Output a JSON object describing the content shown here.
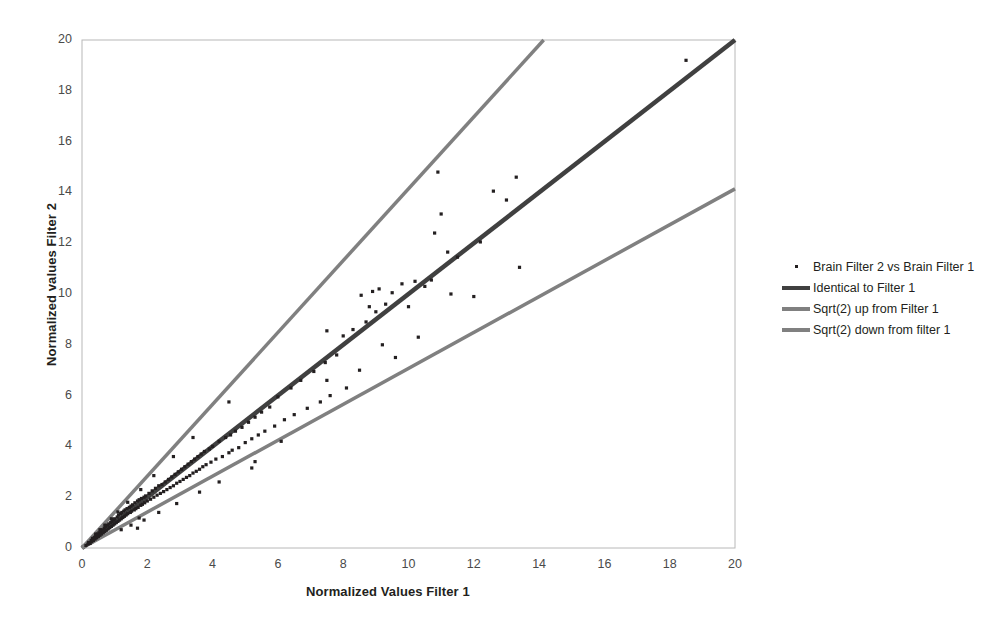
{
  "chart_data": {
    "type": "scatter",
    "title": "",
    "xlabel": "Normalized Values Filter 1",
    "ylabel": "Normalized values Filter 2",
    "xlim": [
      0,
      20
    ],
    "ylim": [
      0,
      20
    ],
    "xticks": [
      0,
      2,
      4,
      6,
      8,
      10,
      12,
      14,
      16,
      18,
      20
    ],
    "yticks": [
      0,
      2,
      4,
      6,
      8,
      10,
      12,
      14,
      16,
      18,
      20
    ],
    "grid": false,
    "legend_position": "right",
    "series": [
      {
        "name": "Brain Filter 2 vs Brain Filter 1",
        "type": "scatter",
        "marker": "square",
        "color": "#231f20",
        "points": [
          [
            0.12,
            0.1
          ],
          [
            0.18,
            0.15
          ],
          [
            0.2,
            0.22
          ],
          [
            0.25,
            0.18
          ],
          [
            0.28,
            0.3
          ],
          [
            0.3,
            0.25
          ],
          [
            0.32,
            0.38
          ],
          [
            0.35,
            0.3
          ],
          [
            0.38,
            0.42
          ],
          [
            0.4,
            0.35
          ],
          [
            0.42,
            0.5
          ],
          [
            0.45,
            0.4
          ],
          [
            0.48,
            0.55
          ],
          [
            0.5,
            0.45
          ],
          [
            0.52,
            0.6
          ],
          [
            0.55,
            0.5
          ],
          [
            0.58,
            0.65
          ],
          [
            0.6,
            0.55
          ],
          [
            0.62,
            0.72
          ],
          [
            0.65,
            0.6
          ],
          [
            0.68,
            0.78
          ],
          [
            0.7,
            0.65
          ],
          [
            0.72,
            0.85
          ],
          [
            0.75,
            0.7
          ],
          [
            0.78,
            0.9
          ],
          [
            0.8,
            0.75
          ],
          [
            0.82,
            0.95
          ],
          [
            0.85,
            0.8
          ],
          [
            0.88,
            1.0
          ],
          [
            0.9,
            0.85
          ],
          [
            0.92,
            1.05
          ],
          [
            0.95,
            0.9
          ],
          [
            0.98,
            1.1
          ],
          [
            1.0,
            0.95
          ],
          [
            1.0,
            1.15
          ],
          [
            1.05,
            1.0
          ],
          [
            1.08,
            1.22
          ],
          [
            1.1,
            1.05
          ],
          [
            1.12,
            1.3
          ],
          [
            1.15,
            1.1
          ],
          [
            1.18,
            1.35
          ],
          [
            1.2,
            1.15
          ],
          [
            1.22,
            1.4
          ],
          [
            1.25,
            1.2
          ],
          [
            1.28,
            1.45
          ],
          [
            1.3,
            1.25
          ],
          [
            1.32,
            1.5
          ],
          [
            1.35,
            1.3
          ],
          [
            1.38,
            1.55
          ],
          [
            1.4,
            1.35
          ],
          [
            1.45,
            1.6
          ],
          [
            1.48,
            1.4
          ],
          [
            1.5,
            1.65
          ],
          [
            1.52,
            1.45
          ],
          [
            1.55,
            1.7
          ],
          [
            1.6,
            1.5
          ],
          [
            1.62,
            1.78
          ],
          [
            1.65,
            1.55
          ],
          [
            1.7,
            1.85
          ],
          [
            1.72,
            1.6
          ],
          [
            1.75,
            1.9
          ],
          [
            1.8,
            1.68
          ],
          [
            1.82,
            1.95
          ],
          [
            1.85,
            1.72
          ],
          [
            1.9,
            2.0
          ],
          [
            1.92,
            1.78
          ],
          [
            1.95,
            2.05
          ],
          [
            1.7,
            0.78
          ],
          [
            1.75,
            1.18
          ],
          [
            2.0,
            1.85
          ],
          [
            2.05,
            2.15
          ],
          [
            2.1,
            1.92
          ],
          [
            2.15,
            2.25
          ],
          [
            2.2,
            2.0
          ],
          [
            2.25,
            2.35
          ],
          [
            2.3,
            2.08
          ],
          [
            2.35,
            2.45
          ],
          [
            2.4,
            2.15
          ],
          [
            2.45,
            2.5
          ],
          [
            2.5,
            2.22
          ],
          [
            2.55,
            2.6
          ],
          [
            2.6,
            2.3
          ],
          [
            2.65,
            2.7
          ],
          [
            2.7,
            2.38
          ],
          [
            2.75,
            2.8
          ],
          [
            2.8,
            2.45
          ],
          [
            2.85,
            2.9
          ],
          [
            2.9,
            2.55
          ],
          [
            2.95,
            3.0
          ],
          [
            3.0,
            2.62
          ],
          [
            3.05,
            3.1
          ],
          [
            3.1,
            2.7
          ],
          [
            3.15,
            3.2
          ],
          [
            3.2,
            2.78
          ],
          [
            3.25,
            3.3
          ],
          [
            3.3,
            2.85
          ],
          [
            3.35,
            3.4
          ],
          [
            3.4,
            2.95
          ],
          [
            3.45,
            3.5
          ],
          [
            3.5,
            3.02
          ],
          [
            3.55,
            3.6
          ],
          [
            3.6,
            3.1
          ],
          [
            3.65,
            3.7
          ],
          [
            3.7,
            3.2
          ],
          [
            3.75,
            3.8
          ],
          [
            3.8,
            3.28
          ],
          [
            3.9,
            3.9
          ],
          [
            3.95,
            3.38
          ],
          [
            4.0,
            4.0
          ],
          [
            4.1,
            3.5
          ],
          [
            4.2,
            4.2
          ],
          [
            4.3,
            3.6
          ],
          [
            4.4,
            4.35
          ],
          [
            4.5,
            3.75
          ],
          [
            4.55,
            4.45
          ],
          [
            4.6,
            3.85
          ],
          [
            4.7,
            4.6
          ],
          [
            4.8,
            3.95
          ],
          [
            4.5,
            5.75
          ],
          [
            4.9,
            4.75
          ],
          [
            5.0,
            4.15
          ],
          [
            5.1,
            4.95
          ],
          [
            5.2,
            4.3
          ],
          [
            5.3,
            5.15
          ],
          [
            5.4,
            4.45
          ],
          [
            5.5,
            5.35
          ],
          [
            5.2,
            3.15
          ],
          [
            5.6,
            4.6
          ],
          [
            5.75,
            5.55
          ],
          [
            5.9,
            4.8
          ],
          [
            6.0,
            5.95
          ],
          [
            6.2,
            5.05
          ],
          [
            6.4,
            6.3
          ],
          [
            6.5,
            5.25
          ],
          [
            6.7,
            6.6
          ],
          [
            6.9,
            5.5
          ],
          [
            7.1,
            6.95
          ],
          [
            7.3,
            5.75
          ],
          [
            7.45,
            7.3
          ],
          [
            7.5,
            8.55
          ],
          [
            7.6,
            6.0
          ],
          [
            7.8,
            7.6
          ],
          [
            7.5,
            6.6
          ],
          [
            8.0,
            8.35
          ],
          [
            8.1,
            6.3
          ],
          [
            8.3,
            8.6
          ],
          [
            8.5,
            7.0
          ],
          [
            8.55,
            9.95
          ],
          [
            8.7,
            8.9
          ],
          [
            8.8,
            9.5
          ],
          [
            8.9,
            10.1
          ],
          [
            9.0,
            9.3
          ],
          [
            9.1,
            10.2
          ],
          [
            9.2,
            8.0
          ],
          [
            9.3,
            9.6
          ],
          [
            9.5,
            10.05
          ],
          [
            9.6,
            7.5
          ],
          [
            9.8,
            10.4
          ],
          [
            10.0,
            9.5
          ],
          [
            10.2,
            10.5
          ],
          [
            10.3,
            8.3
          ],
          [
            10.5,
            10.3
          ],
          [
            10.7,
            10.55
          ],
          [
            10.8,
            12.4
          ],
          [
            10.9,
            14.8
          ],
          [
            11.0,
            13.15
          ],
          [
            11.2,
            11.65
          ],
          [
            11.3,
            10.0
          ],
          [
            11.5,
            11.45
          ],
          [
            12.0,
            9.9
          ],
          [
            12.2,
            12.05
          ],
          [
            12.6,
            14.05
          ],
          [
            13.0,
            13.7
          ],
          [
            13.3,
            14.6
          ],
          [
            13.4,
            11.05
          ],
          [
            18.5,
            19.2
          ],
          [
            6.1,
            4.2
          ],
          [
            5.3,
            3.4
          ],
          [
            4.2,
            2.6
          ],
          [
            3.6,
            2.2
          ],
          [
            2.9,
            1.75
          ],
          [
            2.35,
            1.4
          ],
          [
            1.9,
            1.1
          ],
          [
            1.5,
            0.9
          ],
          [
            1.2,
            0.72
          ],
          [
            3.4,
            4.35
          ],
          [
            2.8,
            3.6
          ],
          [
            2.2,
            2.85
          ],
          [
            1.8,
            2.3
          ],
          [
            1.4,
            1.8
          ],
          [
            1.1,
            1.42
          ],
          [
            0.9,
            1.15
          ],
          [
            0.7,
            0.9
          ],
          [
            0.55,
            0.72
          ],
          [
            0.42,
            0.55
          ]
        ]
      },
      {
        "name": "Identical to Filter 1",
        "type": "line",
        "color": "#404040",
        "slope": 1.0,
        "from": [
          0,
          0
        ],
        "to": [
          20,
          20
        ]
      },
      {
        "name": "Sqrt(2) up from Filter 1",
        "type": "line",
        "color": "#808080",
        "slope": 1.414,
        "from": [
          0,
          0
        ],
        "to": [
          14.14,
          20
        ]
      },
      {
        "name": "Sqrt(2) down from filter 1",
        "type": "line",
        "color": "#808080",
        "slope": 0.707,
        "from": [
          0,
          0
        ],
        "to": [
          20,
          14.14
        ]
      }
    ]
  },
  "legend": {
    "items": [
      {
        "label": "Brain Filter 2 vs Brain Filter 1",
        "key": "dot",
        "color": "#231f20"
      },
      {
        "label": "Identical to Filter 1",
        "key": "line",
        "color": "#404040"
      },
      {
        "label": "Sqrt(2) up from Filter 1",
        "key": "line",
        "color": "#808080"
      },
      {
        "label": "Sqrt(2) down from filter 1",
        "key": "line",
        "color": "#808080"
      }
    ]
  },
  "axes": {
    "x_title": "Normalized Values Filter 1",
    "y_title": "Normalized values Filter 2",
    "x_tick_labels": [
      "0",
      "2",
      "4",
      "6",
      "8",
      "10",
      "12",
      "14",
      "16",
      "18",
      "20"
    ],
    "y_tick_labels": [
      "0",
      "2",
      "4",
      "6",
      "8",
      "10",
      "12",
      "14",
      "16",
      "18",
      "20"
    ]
  },
  "colors": {
    "frame": "#b8b8b8",
    "text": "#231f20",
    "tick": "#4a4a4a",
    "identity_line": "#404040",
    "sqrt_line": "#808080",
    "marker": "#231f20"
  }
}
